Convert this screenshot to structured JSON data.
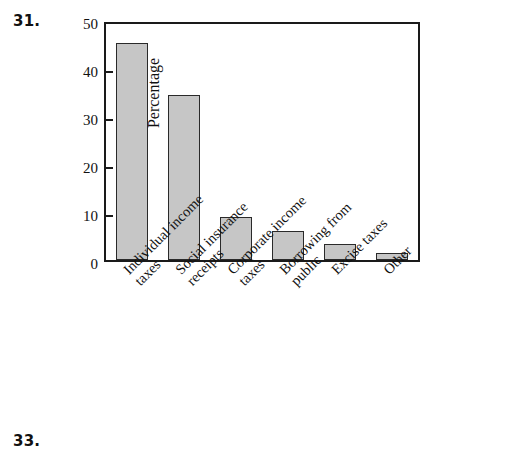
{
  "figure_numbers": {
    "top": "31.",
    "bottom": "33."
  },
  "chart_data": {
    "type": "bar",
    "title": "",
    "xlabel": "",
    "ylabel": "Percentage",
    "ylim": [
      0,
      50
    ],
    "yticks": [
      0,
      10,
      20,
      30,
      40,
      50
    ],
    "ytick_labels": [
      "0",
      "10",
      "20",
      "30",
      "40",
      "50"
    ],
    "grid": false,
    "legend": null,
    "categories": [
      "Individual income taxes",
      "Social insurance receipts",
      "Corporate income taxes",
      "Borrowing from public",
      "Excise taxes",
      "Other"
    ],
    "category_lines": [
      [
        "Individual income",
        "taxes"
      ],
      [
        "Social insurance",
        "receipts"
      ],
      [
        "Corporate income",
        "taxes"
      ],
      [
        "Borrowing from",
        "public"
      ],
      [
        "Excise taxes",
        ""
      ],
      [
        "Other",
        ""
      ]
    ],
    "values": [
      46.0,
      35.0,
      9.2,
      6.2,
      3.3,
      1.4
    ],
    "bar_color": "#c6c6c6",
    "bar_edge_color": "#2a2a2a",
    "axis_color": "#1a1a1a",
    "background": "#ffffff"
  }
}
